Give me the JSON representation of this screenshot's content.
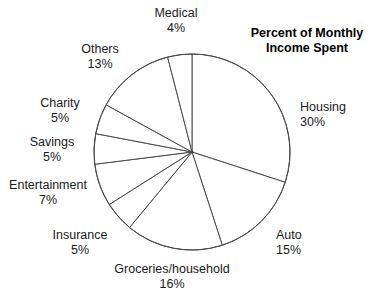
{
  "chart_data": {
    "type": "pie",
    "title": "Percent of Monthly Income Spent",
    "xlabel": "",
    "ylabel": "",
    "legend_position": "none",
    "grid": false,
    "unit": "%",
    "start_angle_deg": 0,
    "direction": "clockwise",
    "categories": [
      "Housing",
      "Auto",
      "Groceries/household",
      "Insurance",
      "Entertainment",
      "Savings",
      "Charity",
      "Others",
      "Medical"
    ],
    "values": [
      30,
      15,
      16,
      5,
      7,
      5,
      5,
      13,
      4
    ],
    "slices": [
      {
        "label": "Housing",
        "value": 30,
        "value_text": "30%",
        "label_x": 300,
        "label_y": 100,
        "align": "left"
      },
      {
        "label": "Auto",
        "value": 15,
        "value_text": "15%",
        "label_x": 276,
        "label_y": 228,
        "align": "left"
      },
      {
        "label": "Groceries/household",
        "value": 16,
        "value_text": "16%",
        "label_x": 172,
        "label_y": 262,
        "align": "center"
      },
      {
        "label": "Insurance",
        "value": 5,
        "value_text": "5%",
        "label_x": 80,
        "label_y": 228,
        "align": "center"
      },
      {
        "label": "Entertainment",
        "value": 7,
        "value_text": "7%",
        "label_x": 48,
        "label_y": 178,
        "align": "center"
      },
      {
        "label": "Savings",
        "value": 5,
        "value_text": "5%",
        "label_x": 52,
        "label_y": 135,
        "align": "center"
      },
      {
        "label": "Charity",
        "value": 5,
        "value_text": "5%",
        "label_x": 60,
        "label_y": 96,
        "align": "center"
      },
      {
        "label": "Others",
        "value": 13,
        "value_text": "13%",
        "label_x": 100,
        "label_y": 42,
        "align": "center"
      },
      {
        "label": "Medical",
        "value": 4,
        "value_text": "4%",
        "label_x": 176,
        "label_y": 6,
        "align": "center"
      }
    ],
    "geometry": {
      "center_x": 192,
      "center_y": 152,
      "radius": 98,
      "stroke_color": "#4a4a4a",
      "fill_color": "#ffffff"
    }
  },
  "title_block": {
    "text": "Percent of Monthly\nIncome Spent",
    "x": 248,
    "y": 26,
    "width": 118
  }
}
